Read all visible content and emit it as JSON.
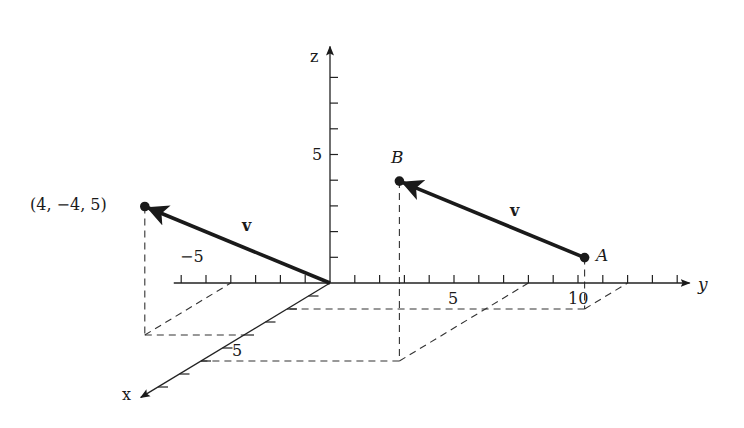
{
  "diagram": {
    "projection": {
      "origin_px": [
        330,
        283
      ],
      "x_unit_px": [
        -21.5,
        13
      ],
      "y_unit_px": [
        24.8,
        0
      ],
      "z_unit_px": [
        0,
        -25.7
      ]
    },
    "axes": {
      "x": {
        "label": "x",
        "min": 0,
        "max": 8.8,
        "tick_label": "5",
        "tick_label_value": 5
      },
      "y": {
        "label": "y",
        "min": -6.3,
        "max": 14.5,
        "tick_labels": [
          {
            "value": -5,
            "text": "−5"
          },
          {
            "value": 5,
            "text": "5"
          },
          {
            "value": 10,
            "text": "10"
          }
        ]
      },
      "z": {
        "label": "z",
        "min": 0,
        "max": 9.2,
        "tick_label": "5",
        "tick_label_value": 5
      }
    },
    "points": {
      "P": {
        "coords": [
          4,
          -4,
          5
        ],
        "label": "(4,  −4, 5)"
      },
      "A": {
        "coords": [
          2,
          12,
          2
        ],
        "label": "A"
      },
      "B": {
        "coords": [
          6,
          8,
          7
        ],
        "label": "B"
      }
    },
    "vectors": [
      {
        "from": "origin",
        "to": "P",
        "label": "v"
      },
      {
        "from": "A",
        "to": "B",
        "label": "v"
      }
    ]
  }
}
